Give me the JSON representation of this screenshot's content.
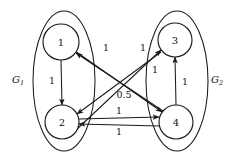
{
  "figure": {
    "type": "directed-graph-diagram",
    "background": "#ffffff",
    "stroke_color": "#1a1a1a",
    "width": 235,
    "height": 159
  },
  "groups": [
    {
      "id": "G1",
      "label_base": "G",
      "label_sub": "1",
      "label_x": 18,
      "label_y": 80,
      "ellipse": {
        "cx": 64,
        "cy": 81,
        "rx": 31,
        "ry": 70
      },
      "members": [
        "1",
        "2"
      ]
    },
    {
      "id": "G2",
      "label_base": "G",
      "label_sub": "2",
      "label_x": 219,
      "label_y": 80,
      "ellipse": {
        "cx": 177,
        "cy": 81,
        "rx": 31,
        "ry": 70
      },
      "members": [
        "3",
        "4"
      ]
    }
  ],
  "nodes": [
    {
      "id": "1",
      "label": "1",
      "cx": 61,
      "cy": 42,
      "r": 18
    },
    {
      "id": "2",
      "label": "2",
      "cx": 62,
      "cy": 122,
      "r": 17
    },
    {
      "id": "3",
      "label": "3",
      "cx": 175,
      "cy": 40,
      "r": 17
    },
    {
      "id": "4",
      "label": "4",
      "cx": 176,
      "cy": 122,
      "r": 17
    }
  ],
  "edges": [
    {
      "id": "e-1-2",
      "from": "1",
      "to": "2",
      "weight": "1",
      "label_x": 52,
      "label_y": 81,
      "x1": 61,
      "y1": 60,
      "x2": 62,
      "y2": 105
    },
    {
      "id": "e-4-3",
      "from": "4",
      "to": "3",
      "weight": "1",
      "label_x": 185,
      "label_y": 82,
      "x1": 176,
      "y1": 105,
      "x2": 175,
      "y2": 57
    },
    {
      "id": "e-4-1",
      "from": "4",
      "to": "1",
      "weight": "1",
      "label_x": 106,
      "label_y": 48,
      "x1": 163,
      "y1": 111,
      "x2": 76,
      "y2": 53
    },
    {
      "id": "e-2-3",
      "from": "2",
      "to": "3",
      "weight": "1",
      "label_x": 143,
      "label_y": 48,
      "x1": 76,
      "y1": 130,
      "x2": 161,
      "y2": 50
    },
    {
      "id": "e-1-4",
      "from": "1",
      "to": "4",
      "weight": "1",
      "label_x": 155,
      "label_y": 70,
      "x1": 75,
      "y1": 51,
      "x2": 162,
      "y2": 112
    },
    {
      "id": "e-3-2",
      "from": "3",
      "to": "2",
      "weight": "0.5",
      "label_x": 124,
      "label_y": 95,
      "x1": 161,
      "y1": 52,
      "x2": 77,
      "y2": 114
    },
    {
      "id": "e-2-4",
      "from": "2",
      "to": "4",
      "weight": "1",
      "label_x": 119,
      "label_y": 111,
      "x1": 79,
      "y1": 119,
      "x2": 159,
      "y2": 117
    },
    {
      "id": "e-4-2",
      "from": "4",
      "to": "2",
      "weight": "1",
      "label_x": 119,
      "label_y": 132,
      "x1": 159,
      "y1": 126,
      "x2": 79,
      "y2": 124
    }
  ]
}
